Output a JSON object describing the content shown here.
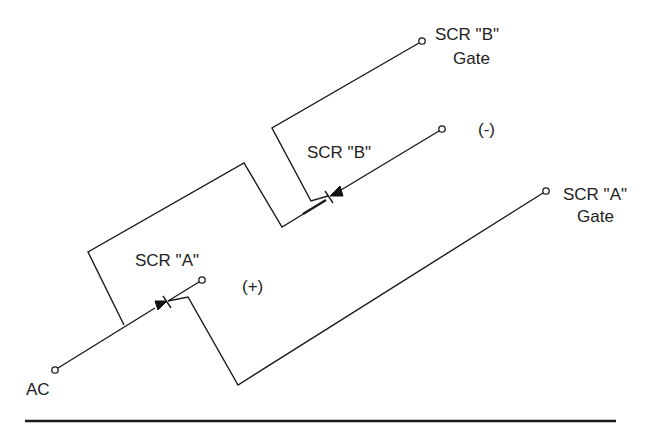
{
  "diagram": {
    "type": "circuit-schematic",
    "colors": {
      "line": "#1a1a1a",
      "text": "#222222",
      "background": "#ffffff"
    },
    "labels": {
      "ac": "AC",
      "scr_a": "SCR \"A\"",
      "scr_b": "SCR \"B\"",
      "plus": "(+)",
      "minus": "(-)",
      "scr_b_gate_line1": "SCR \"B\"",
      "scr_b_gate_line2": "Gate",
      "scr_a_gate_line1": "SCR \"A\"",
      "scr_a_gate_line2": "Gate"
    },
    "terminals": [
      {
        "id": "ac",
        "label": "AC"
      },
      {
        "id": "plus",
        "label": "(+)"
      },
      {
        "id": "minus",
        "label": "(-)"
      },
      {
        "id": "scr-a-gate",
        "label": "SCR \"A\" Gate"
      },
      {
        "id": "scr-b-gate",
        "label": "SCR \"B\" Gate"
      }
    ],
    "components": [
      {
        "id": "scr-a",
        "label": "SCR \"A\"",
        "type": "SCR"
      },
      {
        "id": "scr-b",
        "label": "SCR \"B\"",
        "type": "SCR"
      }
    ]
  }
}
